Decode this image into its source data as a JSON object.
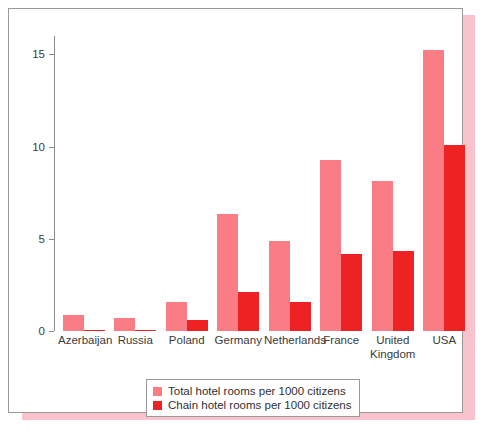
{
  "chart_data": {
    "type": "bar",
    "title": "",
    "xlabel": "",
    "ylabel": "",
    "ylim": [
      0,
      16
    ],
    "yticks": [
      0,
      5,
      10,
      15
    ],
    "ytick_labels": [
      "0",
      "5",
      "10",
      "15"
    ],
    "grid": false,
    "legend_position": "bottom-center",
    "categories": [
      "Azerbaijan",
      "Russia",
      "Poland",
      "Germany",
      "Netherlands",
      "France",
      "United\nKingdom",
      "USA"
    ],
    "series": [
      {
        "name": "Total hotel rooms per 1000 citizens",
        "color": "#FA7C85",
        "values": [
          0.85,
          0.7,
          1.55,
          6.35,
          4.9,
          9.3,
          8.15,
          15.25
        ]
      },
      {
        "name": "Chain hotel rooms per 1000 citizens",
        "color": "#EE2222",
        "values": [
          0.05,
          0.05,
          0.6,
          2.1,
          1.6,
          4.15,
          4.35,
          10.1
        ]
      }
    ]
  },
  "legend": {
    "items": [
      {
        "label": "Total hotel rooms per 1000 citizens",
        "swatch": "total"
      },
      {
        "label": "Chain hotel rooms per 1000 citizens",
        "swatch": "chain"
      }
    ]
  },
  "colors": {
    "total_bar": "#FA7C85",
    "chain_bar": "#EE2222",
    "shadow": "#F9C2CC",
    "frame_border": "#9a9a9a",
    "axis": "#8c8c8c",
    "text": "#3a3a3a",
    "background": "#ffffff"
  }
}
